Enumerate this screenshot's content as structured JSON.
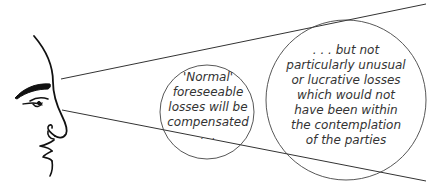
{
  "diagram": {
    "type": "remoteness-of-damage-illustration",
    "figure": "human-head-profile",
    "small_circle": {
      "lines": [
        "'Normal'",
        "foreseeable",
        "losses will be",
        "compensated",
        ". . ."
      ]
    },
    "large_circle": {
      "lines": [
        ". . . but not",
        "particularly unusual",
        "or lucrative losses",
        "which would not",
        "have been within",
        "the contemplation",
        "of the parties"
      ]
    },
    "colors": {
      "line": "#333333",
      "text": "#333333",
      "background": "#ffffff"
    }
  }
}
